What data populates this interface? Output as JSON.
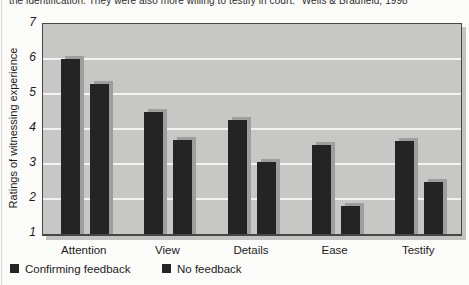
{
  "caption": {
    "text": "the identification. They were also more willing to testify in court.\" Wells & Bradfield, 1998"
  },
  "chart_data": {
    "type": "bar",
    "title": "",
    "xlabel": "",
    "ylabel": "Ratings of witnessing experience",
    "ylim": [
      1,
      7
    ],
    "yticks": [
      1,
      2,
      3,
      4,
      5,
      6,
      7
    ],
    "grid": true,
    "legend_position": "bottom-left",
    "source": "Wells & Bradfield, 1998",
    "categories": [
      "Attention",
      "View",
      "Details",
      "Ease",
      "Testify"
    ],
    "series": [
      {
        "name": "Confirming feedback",
        "values": [
          6.0,
          4.5,
          4.25,
          3.55,
          3.65
        ]
      },
      {
        "name": "No feedback",
        "values": [
          5.3,
          3.7,
          3.05,
          1.8,
          2.5
        ]
      }
    ],
    "colors": {
      "bar": "#242424",
      "bar_shadow": "#9e9e9c",
      "plot_bg": "#c7c7c5",
      "gridline": "#f3f3f1",
      "page_bg": "#fbfbf9"
    }
  }
}
